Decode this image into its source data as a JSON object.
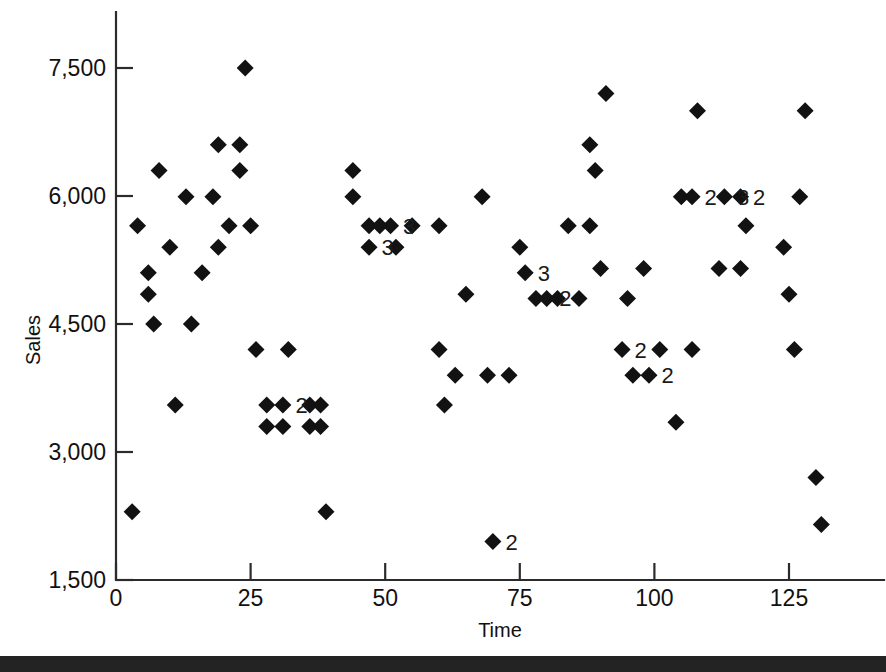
{
  "chart_data": {
    "type": "scatter",
    "title": "",
    "xlabel": "Time",
    "ylabel": "Sales",
    "xlim": [
      0,
      135
    ],
    "ylim": [
      1500,
      8000
    ],
    "xticks": [
      0,
      25,
      50,
      75,
      100,
      125
    ],
    "xticklabels": [
      "0",
      "25",
      "50",
      "75",
      "100",
      "125"
    ],
    "yticks": [
      1500,
      3000,
      4500,
      6000,
      7500
    ],
    "yticklabels": [
      "1,500",
      "3,000",
      "4,500",
      "6,000",
      "7,500"
    ],
    "grid": false,
    "legend": null,
    "marker": "diamond",
    "marker_color": "#121212",
    "points": [
      {
        "x": 3,
        "y": 2300
      },
      {
        "x": 4,
        "y": 5650
      },
      {
        "x": 6,
        "y": 5100
      },
      {
        "x": 6,
        "y": 4850
      },
      {
        "x": 7,
        "y": 4500
      },
      {
        "x": 8,
        "y": 6300
      },
      {
        "x": 10,
        "y": 5400
      },
      {
        "x": 11,
        "y": 3550
      },
      {
        "x": 13,
        "y": 5990
      },
      {
        "x": 14,
        "y": 4500
      },
      {
        "x": 16,
        "y": 5100
      },
      {
        "x": 18,
        "y": 5990
      },
      {
        "x": 19,
        "y": 6600
      },
      {
        "x": 19,
        "y": 5400
      },
      {
        "x": 21,
        "y": 5650
      },
      {
        "x": 23,
        "y": 6600
      },
      {
        "x": 23,
        "y": 6300
      },
      {
        "x": 24,
        "y": 7500
      },
      {
        "x": 25,
        "y": 5650
      },
      {
        "x": 26,
        "y": 4200
      },
      {
        "x": 28,
        "y": 3550
      },
      {
        "x": 28,
        "y": 3300
      },
      {
        "x": 31,
        "y": 3550,
        "count": 2,
        "label": "2"
      },
      {
        "x": 31,
        "y": 3300
      },
      {
        "x": 32,
        "y": 4200
      },
      {
        "x": 36,
        "y": 3550
      },
      {
        "x": 36,
        "y": 3300
      },
      {
        "x": 38,
        "y": 3550
      },
      {
        "x": 38,
        "y": 3300
      },
      {
        "x": 39,
        "y": 2300
      },
      {
        "x": 44,
        "y": 6300
      },
      {
        "x": 44,
        "y": 5990
      },
      {
        "x": 47,
        "y": 5650
      },
      {
        "x": 47,
        "y": 5400,
        "count": 3,
        "label": "3"
      },
      {
        "x": 49,
        "y": 5650
      },
      {
        "x": 51,
        "y": 5650,
        "count": 3,
        "label": "3"
      },
      {
        "x": 52,
        "y": 5400
      },
      {
        "x": 55,
        "y": 5650
      },
      {
        "x": 60,
        "y": 5650
      },
      {
        "x": 60,
        "y": 4200
      },
      {
        "x": 61,
        "y": 3550
      },
      {
        "x": 63,
        "y": 3900
      },
      {
        "x": 65,
        "y": 4850
      },
      {
        "x": 68,
        "y": 5990
      },
      {
        "x": 69,
        "y": 3900
      },
      {
        "x": 70,
        "y": 1950,
        "count": 2,
        "label": "2"
      },
      {
        "x": 73,
        "y": 3900
      },
      {
        "x": 75,
        "y": 5400
      },
      {
        "x": 76,
        "y": 5100,
        "count": 3,
        "label": "3"
      },
      {
        "x": 78,
        "y": 4800
      },
      {
        "x": 80,
        "y": 4800,
        "count": 2,
        "label": "2"
      },
      {
        "x": 82,
        "y": 4800
      },
      {
        "x": 84,
        "y": 5650
      },
      {
        "x": 86,
        "y": 4800
      },
      {
        "x": 88,
        "y": 5650
      },
      {
        "x": 88,
        "y": 6600
      },
      {
        "x": 89,
        "y": 6300
      },
      {
        "x": 90,
        "y": 5150
      },
      {
        "x": 91,
        "y": 7200
      },
      {
        "x": 94,
        "y": 4200,
        "count": 2,
        "label": "2"
      },
      {
        "x": 95,
        "y": 4800
      },
      {
        "x": 96,
        "y": 3900
      },
      {
        "x": 98,
        "y": 5150
      },
      {
        "x": 99,
        "y": 3900,
        "count": 2,
        "label": "2"
      },
      {
        "x": 101,
        "y": 4200
      },
      {
        "x": 104,
        "y": 3350
      },
      {
        "x": 105,
        "y": 5990
      },
      {
        "x": 107,
        "y": 5990,
        "count": 2,
        "label": "2"
      },
      {
        "x": 107,
        "y": 4200
      },
      {
        "x": 108,
        "y": 7000
      },
      {
        "x": 112,
        "y": 5150
      },
      {
        "x": 113,
        "y": 5990,
        "count": 3,
        "label": "3"
      },
      {
        "x": 116,
        "y": 5990,
        "count": 2,
        "label": "2"
      },
      {
        "x": 116,
        "y": 5150
      },
      {
        "x": 117,
        "y": 5650
      },
      {
        "x": 124,
        "y": 5400
      },
      {
        "x": 125,
        "y": 4850
      },
      {
        "x": 126,
        "y": 4200
      },
      {
        "x": 127,
        "y": 5990
      },
      {
        "x": 128,
        "y": 7000
      },
      {
        "x": 130,
        "y": 2700
      },
      {
        "x": 131,
        "y": 2150
      }
    ]
  },
  "axes": {
    "y_title": "Sales",
    "x_title": "Time"
  }
}
